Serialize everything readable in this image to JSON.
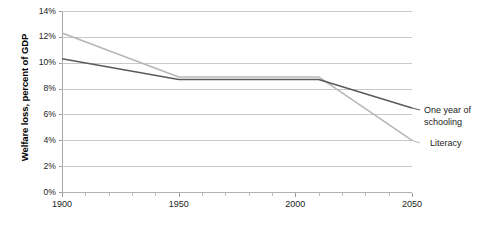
{
  "chart_data": {
    "type": "line",
    "title": "",
    "xlabel": "",
    "ylabel": "Welfare loss, percent of GDP",
    "xlim": [
      1900,
      2050
    ],
    "ylim": [
      0,
      14
    ],
    "grid": true,
    "legend_position": "right-inline-labels",
    "y_ticks": [
      "0%",
      "2%",
      "4%",
      "6%",
      "8%",
      "10%",
      "12%",
      "14%"
    ],
    "y_tick_values": [
      0,
      2,
      4,
      6,
      8,
      10,
      12,
      14
    ],
    "x_ticks": [
      "1900",
      "1950",
      "2000",
      "2050"
    ],
    "x_tick_values": [
      1900,
      1950,
      2000,
      2050
    ],
    "x_minor_step": 10,
    "x": [
      1900,
      1950,
      2010,
      2050
    ],
    "series": [
      {
        "name": "Literacy",
        "color": "#b6b6b6",
        "values": [
          12.3,
          8.9,
          8.9,
          4.0
        ]
      },
      {
        "name": "One year of schooling",
        "color": "#5a5a5a",
        "values": [
          10.3,
          8.7,
          8.7,
          6.5
        ]
      }
    ]
  },
  "axis": {
    "y_title": "Welfare loss, percent of GDP"
  },
  "labels": {
    "schooling": "One year of schooling",
    "literacy": "Literacy"
  },
  "colors": {
    "literacy_line": "#b6b6b6",
    "schooling_line": "#5a5a5a",
    "gridline": "#c9c9c9",
    "axis": "#a8a8a8",
    "text": "#1c1c1c"
  }
}
